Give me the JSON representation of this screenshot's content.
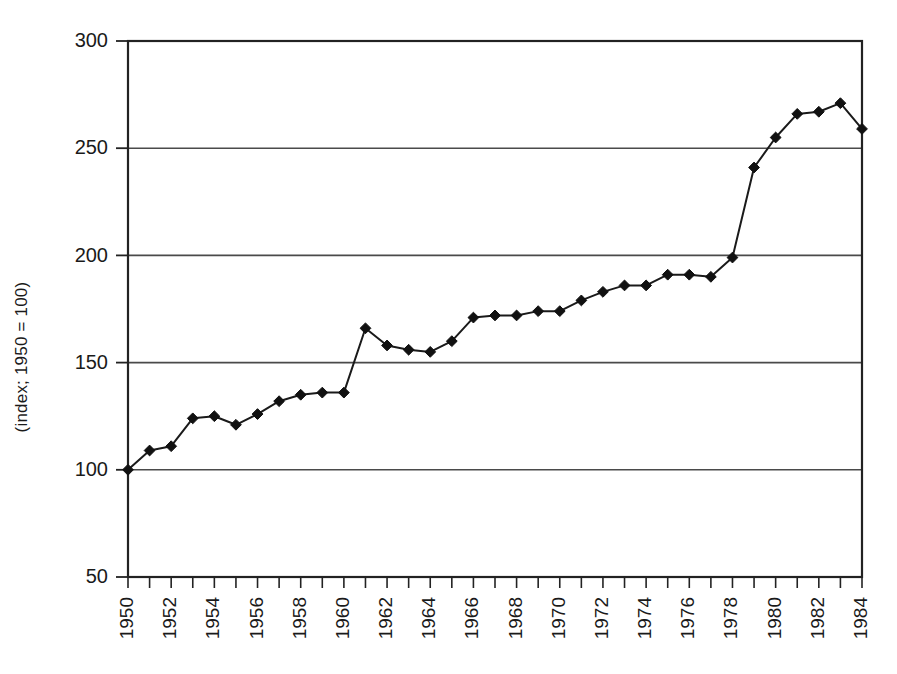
{
  "chart_data": {
    "type": "line",
    "title": "",
    "subtitle": "",
    "xlabel": "",
    "ylabel": "(index; 1950 = 100)",
    "ylim": [
      50,
      300
    ],
    "xlim": [
      1950,
      1984
    ],
    "y_ticks": [
      50,
      100,
      150,
      200,
      250,
      300
    ],
    "x_ticks": [
      1950,
      1951,
      1952,
      1953,
      1954,
      1955,
      1956,
      1957,
      1958,
      1959,
      1960,
      1961,
      1962,
      1963,
      1964,
      1965,
      1966,
      1967,
      1968,
      1969,
      1970,
      1971,
      1972,
      1973,
      1974,
      1975,
      1976,
      1977,
      1978,
      1979,
      1980,
      1981,
      1982,
      1983,
      1984
    ],
    "x_tick_labels": [
      "1950",
      "",
      "1952",
      "",
      "1954",
      "",
      "1956",
      "",
      "1958",
      "",
      "1960",
      "",
      "1962",
      "",
      "1964",
      "",
      "1966",
      "",
      "1968",
      "",
      "1970",
      "",
      "1972",
      "",
      "1974",
      "",
      "1976",
      "",
      "1978",
      "",
      "1980",
      "",
      "1982",
      "",
      "1984"
    ],
    "x_tick_label_rotation": -90,
    "grid": "horizontal",
    "legend": "none",
    "marker": "diamond",
    "line_color": "#1a1a1a",
    "marker_color": "#111111",
    "background_color": "#ffffff",
    "categories": [
      1950,
      1951,
      1952,
      1953,
      1954,
      1955,
      1956,
      1957,
      1958,
      1959,
      1960,
      1961,
      1962,
      1963,
      1964,
      1965,
      1966,
      1967,
      1968,
      1969,
      1970,
      1971,
      1972,
      1973,
      1974,
      1975,
      1976,
      1977,
      1978,
      1979,
      1980,
      1981,
      1982,
      1983,
      1984
    ],
    "values": [
      100,
      109,
      111,
      124,
      125,
      121,
      126,
      132,
      135,
      136,
      136,
      166,
      158,
      156,
      155,
      160,
      171,
      172,
      172,
      174,
      174,
      179,
      183,
      186,
      186,
      191,
      191,
      190,
      199,
      241,
      255,
      266,
      267,
      271,
      259
    ],
    "series": [
      {
        "name": "index",
        "values": [
          100,
          109,
          111,
          124,
          125,
          121,
          126,
          132,
          135,
          136,
          136,
          166,
          158,
          156,
          155,
          160,
          171,
          172,
          172,
          174,
          174,
          179,
          183,
          186,
          186,
          191,
          191,
          190,
          199,
          241,
          255,
          266,
          267,
          271,
          259
        ]
      }
    ]
  },
  "layout": {
    "plot_left": 128,
    "plot_right": 862,
    "plot_top": 41,
    "plot_bottom": 577
  }
}
